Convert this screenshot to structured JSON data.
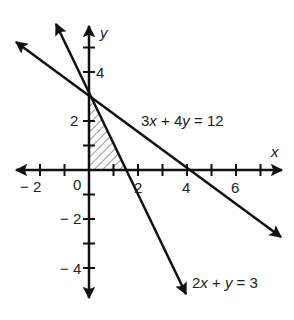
{
  "diagram": {
    "type": "coordinate-plane-linear-inequalities",
    "axes": {
      "x_label": "x",
      "y_label": "y",
      "x_range": [
        -3,
        7
      ],
      "y_range": [
        -5,
        5
      ],
      "x_tick_labels": [
        {
          "value": -2,
          "text": "− 2"
        },
        {
          "value": 0,
          "text": "0"
        },
        {
          "value": 2,
          "text": "2"
        },
        {
          "value": 4,
          "text": "4"
        },
        {
          "value": 6,
          "text": "6"
        }
      ],
      "y_tick_labels": [
        {
          "value": 4,
          "text": "4"
        },
        {
          "value": 2,
          "text": "2"
        },
        {
          "value": -2,
          "text": "− 2"
        },
        {
          "value": -4,
          "text": "− 4"
        }
      ]
    },
    "lines": [
      {
        "id": "line1",
        "equation": "3x + 4y = 12",
        "label_parts": [
          "3",
          "x",
          " + 4",
          "y",
          " = 12"
        ],
        "x_intercept": 4,
        "y_intercept": 3
      },
      {
        "id": "line2",
        "equation": "2x + y = 3",
        "label_parts": [
          "2",
          "x",
          " + ",
          "y",
          " = 3"
        ],
        "x_intercept": 1.5,
        "y_intercept": 3
      }
    ],
    "shaded_region": {
      "description": "Hatched triangle bounded by y-axis, x-axis, and 2x + y = 3",
      "vertices": [
        [
          0,
          0
        ],
        [
          0,
          3
        ],
        [
          1.5,
          0
        ]
      ],
      "pattern": "diagonal-hatch"
    },
    "colors": {
      "stroke": "#111111",
      "background": "#ffffff"
    }
  }
}
